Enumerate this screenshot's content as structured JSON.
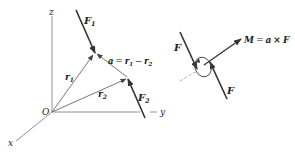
{
  "left_diagram": {
    "axes": {
      "z": "z",
      "y": "y",
      "x": "x",
      "origin": "O"
    },
    "forces": [
      {
        "symbol": "F",
        "subscript": "1"
      },
      {
        "symbol": "F",
        "subscript": "2"
      }
    ],
    "position_vectors": [
      {
        "symbol": "r",
        "subscript": "1"
      },
      {
        "symbol": "r",
        "subscript": "2"
      }
    ],
    "moment_arm": {
      "lhs": "a",
      "eq": "=",
      "r1": "r",
      "r1_sub": "1",
      "minus": "−",
      "r2": "r",
      "r2_sub": "2"
    }
  },
  "right_diagram": {
    "force_top": "F",
    "force_bottom": "F",
    "moment": {
      "lhs": "M",
      "eq": "=",
      "a": "a",
      "times": "×",
      "f": "F"
    }
  },
  "colors": {
    "line": "#333333",
    "thin": "#666666",
    "text": "#222222"
  }
}
